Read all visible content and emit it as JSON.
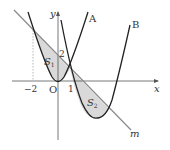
{
  "diagram": {
    "axes": {
      "x_label": "x",
      "y_label": "y",
      "origin_label": "O",
      "tick_labels": {
        "x_neg2": "−2",
        "x_1": "1",
        "y_2": "2"
      }
    },
    "curves": {
      "A": {
        "label": "A",
        "equation": "y = x^2"
      },
      "B": {
        "label": "B"
      },
      "m": {
        "label": "m",
        "equation": "y = -x + 2"
      }
    },
    "regions": {
      "S1": {
        "label": "S",
        "sub": "1"
      },
      "S2": {
        "label": "S",
        "sub": "2"
      }
    },
    "colors": {
      "curve": "#222222",
      "line_m": "#8a8a8a",
      "shade": "#d9d9d9",
      "axis": "#555555"
    }
  }
}
